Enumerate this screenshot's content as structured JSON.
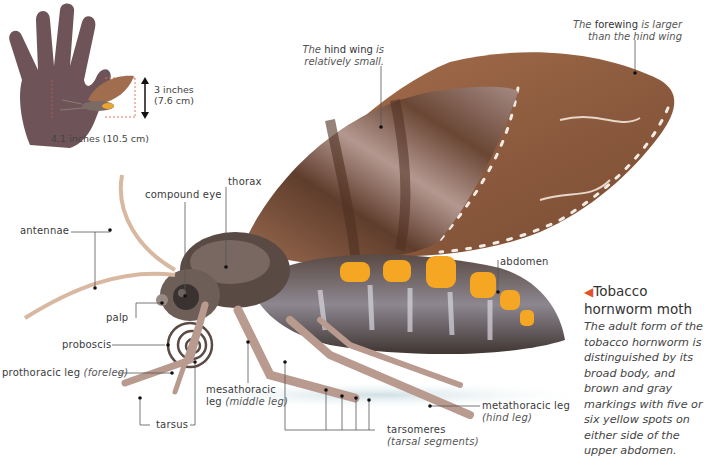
{
  "scale_inset": {
    "height_label_line1": "3 inches",
    "height_label_line2": "(7.6 cm)",
    "width_label": "4.1 inches (10.5 cm)"
  },
  "notes": {
    "hind_wing": {
      "pre": "The",
      "bold": "hind wing",
      "post": "is",
      "line2": "relatively small."
    },
    "forewing": {
      "pre": "The",
      "bold": "forewing",
      "post": "is larger",
      "line2": "than the hind wing"
    }
  },
  "labels": {
    "antennae": "antennae",
    "compound_eye": "compound eye",
    "thorax": "thorax",
    "palp": "palp",
    "proboscis": "proboscis",
    "prothoracic_leg": "prothoracic leg",
    "prothoracic_leg_alt": "(foreleg)",
    "tarsus": "tarsus",
    "mesathoracic_leg_line1": "mesathoracic",
    "mesathoracic_leg_line2": "leg",
    "mesathoracic_leg_alt": "(middle leg)",
    "tarsomeres": "tarsomeres",
    "tarsomeres_alt": "(tarsal segments)",
    "metathoracic_leg": "metathoracic leg",
    "metathoracic_leg_alt": "(hind leg)",
    "abdomen": "abdomen"
  },
  "caption": {
    "marker": "◀",
    "title_line1": "Tobacco",
    "title_line2": "hornworm moth",
    "body": "The adult form of the tobacco hornworm is distinguished by its broad body, and brown and gray markings with five or six yellow spots on either side of the upper abdomen."
  },
  "colors": {
    "hand": "#6e5458",
    "wing_brown": "#8a5a3e",
    "wing_light": "#b98a6c",
    "body_dark": "#4a3e3a",
    "body_gray": "#9a949a",
    "spot_yellow": "#f5a623",
    "accent_red": "#e2512a",
    "leader_line": "#555555"
  }
}
